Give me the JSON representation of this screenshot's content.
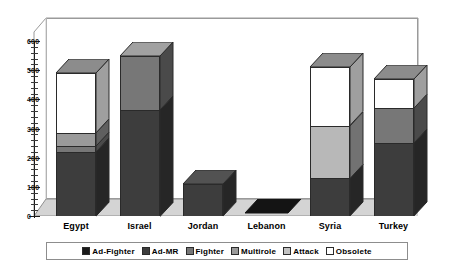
{
  "chart_data": {
    "type": "bar",
    "subtype": "stacked-3d-column",
    "title": "",
    "xlabel": "",
    "ylabel": "",
    "ylim": [
      0,
      600
    ],
    "ytick_step": 100,
    "yticks": [
      "0",
      "100",
      "200",
      "300",
      "400",
      "500",
      "600"
    ],
    "minor_ticks": true,
    "grid": false,
    "legend_position": "bottom",
    "categories": [
      "Egypt",
      "Israel",
      "Jordan",
      "Lebanon",
      "Syria",
      "Turkey"
    ],
    "series": [
      {
        "name": "Ad-Fighter",
        "color": "#1a1a1a",
        "values": [
          0,
          0,
          0,
          0,
          0,
          0
        ]
      },
      {
        "name": "Ad-MR",
        "color": "#3d3d3d",
        "values": [
          220,
          365,
          110,
          0,
          130,
          250
        ]
      },
      {
        "name": "Fighter",
        "color": "#777777",
        "values": [
          20,
          185,
          0,
          0,
          0,
          120
        ]
      },
      {
        "name": "Multirole",
        "color": "#9a9a9a",
        "values": [
          45,
          0,
          0,
          0,
          0,
          0
        ]
      },
      {
        "name": "Attack",
        "color": "#b8b8b8",
        "values": [
          0,
          0,
          0,
          0,
          180,
          0
        ]
      },
      {
        "name": "Obsolete",
        "color": "#ffffff",
        "values": [
          205,
          0,
          0,
          0,
          200,
          100
        ]
      }
    ],
    "totals": [
      490,
      550,
      110,
      0,
      510,
      470
    ]
  },
  "axis": {
    "ticks": [
      {
        "label": "600",
        "value": 600
      },
      {
        "label": "500",
        "value": 500
      },
      {
        "label": "400",
        "value": 400
      },
      {
        "label": "300",
        "value": 300
      },
      {
        "label": "200",
        "value": 200
      },
      {
        "label": "100",
        "value": 100
      },
      {
        "label": "0",
        "value": 0
      }
    ]
  },
  "legend": {
    "items": [
      {
        "label": "Ad-Fighter",
        "color": "#1a1a1a"
      },
      {
        "label": "Ad-MR",
        "color": "#3d3d3d"
      },
      {
        "label": "Fighter",
        "color": "#777777"
      },
      {
        "label": "Multirole",
        "color": "#9a9a9a"
      },
      {
        "label": "Attack",
        "color": "#c2c2c2"
      },
      {
        "label": "Obsolete",
        "color": "#ffffff"
      }
    ]
  },
  "colors": {
    "background": "#ffffff",
    "floor": "#d4d4d4",
    "frame_line": "#9a9a9a",
    "outline": "#2a2a2a"
  }
}
